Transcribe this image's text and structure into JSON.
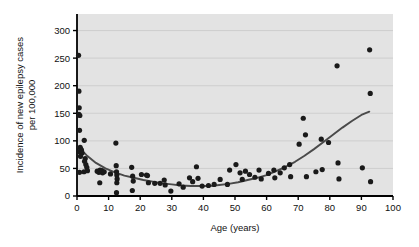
{
  "chart_data": {
    "type": "scatter",
    "title": "",
    "subtitle": "",
    "xlabel": "Age (years)",
    "ylabel_line1": "Incidence of new epilepsy cases",
    "ylabel_line2": "per 100,000",
    "xlim": [
      0,
      100
    ],
    "ylim": [
      0,
      330
    ],
    "xticks": [
      0,
      10,
      20,
      30,
      40,
      50,
      60,
      70,
      80,
      90,
      100
    ],
    "xtick_labels": [
      "0",
      "10",
      "20",
      "30",
      "40",
      "50",
      "60",
      "70",
      "80",
      "90",
      "100"
    ],
    "yticks": [
      0,
      50,
      100,
      150,
      200,
      250,
      300
    ],
    "ytick_labels": [
      "0",
      "50",
      "100",
      "150",
      "200",
      "250",
      "300"
    ],
    "grid": true,
    "grid_axis": "y",
    "legend": "none",
    "plot_background": "#e3e3e3",
    "point_color": "#1a1a1a",
    "curve_color": "#4a4a4a",
    "axis_color": "#000000",
    "grid_color": "#c6c6c6",
    "point_radius": 2.6,
    "points": [
      [
        0.5,
        255
      ],
      [
        0.6,
        190
      ],
      [
        0.7,
        160
      ],
      [
        0.6,
        148
      ],
      [
        0.9,
        146
      ],
      [
        0.8,
        119
      ],
      [
        1.0,
        88
      ],
      [
        1.2,
        85
      ],
      [
        1.4,
        83
      ],
      [
        0.9,
        80
      ],
      [
        1.6,
        78
      ],
      [
        1.1,
        72
      ],
      [
        0.8,
        43
      ],
      [
        2.3,
        101
      ],
      [
        2.6,
        68
      ],
      [
        2.4,
        63
      ],
      [
        2.8,
        57
      ],
      [
        3.1,
        52
      ],
      [
        3.3,
        46
      ],
      [
        2.2,
        44
      ],
      [
        6.4,
        45
      ],
      [
        6.9,
        43
      ],
      [
        7.3,
        47
      ],
      [
        7.6,
        44
      ],
      [
        8.1,
        42
      ],
      [
        7.9,
        46
      ],
      [
        8.6,
        44
      ],
      [
        7.2,
        24
      ],
      [
        12.3,
        96
      ],
      [
        12.4,
        55
      ],
      [
        12.5,
        44
      ],
      [
        12.6,
        38
      ],
      [
        12.7,
        31
      ],
      [
        12.6,
        24
      ],
      [
        12.5,
        6
      ],
      [
        10.6,
        40
      ],
      [
        17.3,
        52
      ],
      [
        17.6,
        36
      ],
      [
        17.8,
        27
      ],
      [
        17.5,
        10
      ],
      [
        20.4,
        39
      ],
      [
        22.0,
        38
      ],
      [
        22.3,
        37
      ],
      [
        22.6,
        24
      ],
      [
        24.6,
        23
      ],
      [
        26.3,
        23
      ],
      [
        27.6,
        29
      ],
      [
        27.9,
        20
      ],
      [
        29.7,
        9
      ],
      [
        32.3,
        22
      ],
      [
        33.6,
        16
      ],
      [
        35.6,
        33
      ],
      [
        36.6,
        26
      ],
      [
        37.8,
        53
      ],
      [
        38.3,
        32
      ],
      [
        39.6,
        18
      ],
      [
        41.6,
        19
      ],
      [
        43.4,
        21
      ],
      [
        45.3,
        30
      ],
      [
        47.6,
        21
      ],
      [
        48.3,
        47
      ],
      [
        50.3,
        57
      ],
      [
        51.6,
        42
      ],
      [
        52.3,
        30
      ],
      [
        53.3,
        45
      ],
      [
        54.6,
        39
      ],
      [
        56.3,
        34
      ],
      [
        57.6,
        47
      ],
      [
        58.3,
        31
      ],
      [
        60.6,
        41
      ],
      [
        62.3,
        47
      ],
      [
        62.6,
        33
      ],
      [
        64.3,
        42
      ],
      [
        65.6,
        51
      ],
      [
        67.3,
        57
      ],
      [
        67.6,
        35
      ],
      [
        70.3,
        94
      ],
      [
        71.6,
        141
      ],
      [
        72.3,
        111
      ],
      [
        72.6,
        35
      ],
      [
        75.6,
        44
      ],
      [
        77.3,
        103
      ],
      [
        77.6,
        48
      ],
      [
        79.6,
        97
      ],
      [
        82.3,
        236
      ],
      [
        82.6,
        60
      ],
      [
        82.9,
        31
      ],
      [
        90.3,
        51
      ],
      [
        92.6,
        265
      ],
      [
        92.8,
        186
      ],
      [
        92.9,
        26
      ]
    ],
    "fit_curve": {
      "description": "U-shaped quadratic fit of incidence versus age",
      "points": [
        [
          0.5,
          89
        ],
        [
          3,
          74
        ],
        [
          6,
          60
        ],
        [
          9,
          50
        ],
        [
          12,
          43
        ],
        [
          15,
          37
        ],
        [
          18,
          33
        ],
        [
          21,
          29
        ],
        [
          24,
          26
        ],
        [
          27,
          23
        ],
        [
          30,
          21
        ],
        [
          33,
          19
        ],
        [
          36,
          18
        ],
        [
          39,
          18
        ],
        [
          42,
          18
        ],
        [
          45,
          20
        ],
        [
          48,
          22
        ],
        [
          51,
          25
        ],
        [
          54,
          29
        ],
        [
          57,
          33
        ],
        [
          60,
          38
        ],
        [
          63,
          45
        ],
        [
          66,
          53
        ],
        [
          69,
          62
        ],
        [
          72,
          73
        ],
        [
          75,
          85
        ],
        [
          78,
          98
        ],
        [
          81,
          111
        ],
        [
          84,
          124
        ],
        [
          87,
          136
        ],
        [
          90,
          147
        ],
        [
          92.5,
          153
        ]
      ]
    }
  }
}
